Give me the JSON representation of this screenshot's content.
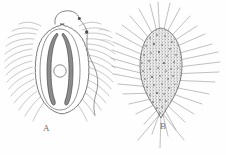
{
  "figure": {
    "kind": "scientific-line-drawing",
    "background_color": "#fefefe",
    "ink_color": "#6b6b6b",
    "dark_ink_color": "#4a4a4a",
    "panels": [
      {
        "id": "A",
        "label": "A",
        "label_x": 43,
        "label_y": 123,
        "description": "Oval cell with crenulated (scalloped) outer wall, inner oval membrane, two elongate dark crescent-shaped bodies flanking a central circular nucleus, fine curved setae radiating outward, and a curved hooked appendage with terminal knob at the apex plus a wavy lateral flagellum bearing a small dark nodule",
        "body_center_x": 60,
        "body_center_y": 72,
        "body_width": 52,
        "body_height": 92,
        "features": [
          "scalloped-outer-wall",
          "inner-oval-membrane",
          "paired-dark-crescents",
          "central-nucleus-circle",
          "radiating-curved-setae",
          "apical-hook-appendage",
          "lateral-flagellum-with-nodule"
        ]
      },
      {
        "id": "B",
        "label": "B",
        "label_x": 160,
        "label_y": 121,
        "description": "Densely stippled granular ovoid body tapering to a point at the base, with numerous long straight bristles radiating in all directions",
        "body_center_x": 161,
        "body_center_y": 72,
        "body_width": 40,
        "body_height": 86,
        "features": [
          "stippled-granular-body",
          "pointed-base",
          "long-straight-radiating-bristles"
        ]
      }
    ]
  }
}
